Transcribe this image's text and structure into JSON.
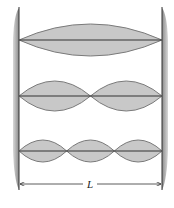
{
  "diagram": {
    "title": "",
    "colors": {
      "wall": "#9a9a9a",
      "wall_edge": "#333333",
      "loop_fill": "#c8c8c8",
      "loop_stroke": "#7a7a7a",
      "string": "#333333"
    },
    "modes": [
      {
        "name": "fundamental",
        "loops": 1
      },
      {
        "name": "second-harmonic",
        "loops": 2
      },
      {
        "name": "third-harmonic",
        "loops": 3
      }
    ],
    "dimension_label": "L"
  }
}
